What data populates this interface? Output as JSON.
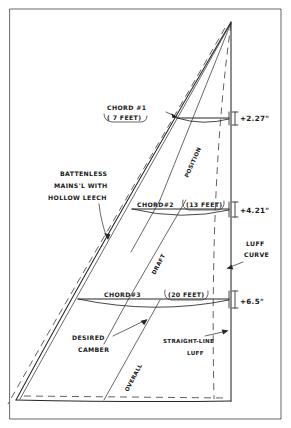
{
  "document": {
    "title": "Sail Broadseaming / Luff Curve Layout Diagram",
    "type": "hand-drawn technical sketch"
  },
  "annotations": {
    "sail_description": {
      "line1": "BATTENLESS",
      "line2": "MAINS'L WITH",
      "line3": "HOLLOW  LEECH"
    },
    "desired_camber": {
      "line1": "DESIRED",
      "line2": "CAMBER"
    },
    "straight_line_luff": {
      "line1": "STRAIGHT-LINE",
      "line2": "LUFF"
    },
    "luff_curve": {
      "line1": "LUFF",
      "line2": "CURVE"
    }
  },
  "axis_labels": {
    "position": "POSITION",
    "draft": "DRAFT",
    "overall": "OVERALL"
  },
  "chords": [
    {
      "id": "chord-1",
      "name": "CHORD #1",
      "length_label": "( 7 FEET)",
      "length_feet": 7,
      "luff_curve_label": "+2.27\"",
      "luff_curve_inches": 2.27
    },
    {
      "id": "chord-2",
      "name": "CHORD#2",
      "length_label": "(13 FEET)",
      "length_feet": 13,
      "luff_curve_label": "+4.21\"",
      "luff_curve_inches": 4.21
    },
    {
      "id": "chord-3",
      "name": "CHORD#3",
      "length_label": "(20 FEET)",
      "length_feet": 20,
      "luff_curve_label": "+6.5\"",
      "luff_curve_inches": 6.5
    }
  ],
  "colors": {
    "ink": "#262626",
    "paper": "#ffffff",
    "dashed": "#3a3a3a"
  }
}
